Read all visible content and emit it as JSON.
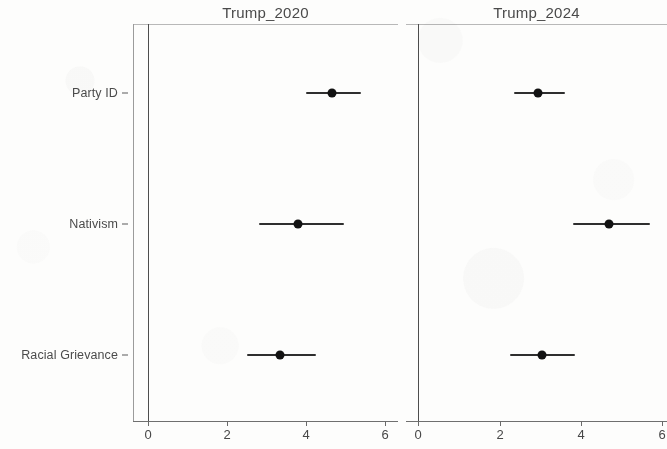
{
  "chart_data": {
    "type": "scatter",
    "plot_style": "coefficient-plot",
    "title": "",
    "xlabel": "",
    "ylabel": "",
    "xlim": [
      -0.35,
      6.4
    ],
    "xticks": [
      0,
      2,
      4,
      6
    ],
    "xticklabels": [
      "0",
      "2",
      "4",
      "6"
    ],
    "grid": false,
    "legend": false,
    "zero_reference_line": 0,
    "categories": [
      "Party ID",
      "Nativism",
      "Racial Grievance"
    ],
    "panels": [
      {
        "label": "Trump_2020",
        "points": [
          {
            "category": "Party ID",
            "estimate": 4.65,
            "ci_low": 4.0,
            "ci_high": 5.4
          },
          {
            "category": "Nativism",
            "estimate": 3.8,
            "ci_low": 2.8,
            "ci_high": 4.95
          },
          {
            "category": "Racial Grievance",
            "estimate": 3.35,
            "ci_low": 2.5,
            "ci_high": 4.25
          }
        ]
      },
      {
        "label": "Trump_2024",
        "points": [
          {
            "category": "Party ID",
            "estimate": 2.95,
            "ci_low": 2.35,
            "ci_high": 3.6
          },
          {
            "category": "Nativism",
            "estimate": 4.7,
            "ci_low": 3.8,
            "ci_high": 5.7
          },
          {
            "category": "Racial Grievance",
            "estimate": 3.05,
            "ci_low": 2.25,
            "ci_high": 3.85
          }
        ]
      }
    ],
    "colors": {
      "point": "#121212",
      "interval": "#2e2e2e",
      "axis": "#6a6a6a",
      "text": "#454545",
      "background": "#fdfdfc"
    }
  },
  "axis": {
    "category_labels": [
      "Party ID",
      "Nativism",
      "Racial Grievance"
    ],
    "tick_labels": [
      "0",
      "2",
      "4",
      "6"
    ]
  },
  "panel_titles": {
    "left": "Trump_2020",
    "right": "Trump_2024"
  }
}
